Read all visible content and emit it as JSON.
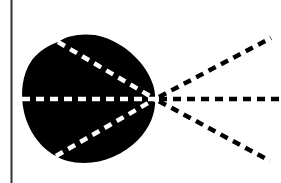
{
  "diagram": {
    "title": "",
    "colors": {
      "background": "#ffffff",
      "shape_fill": "#000000",
      "inner_dash": "#ffffff",
      "outer_dash": "#000000",
      "border_line": "#333333"
    },
    "border_line": {
      "x": 11.5,
      "y1": 0,
      "y2": 183
    },
    "focal_point": {
      "x": 155,
      "y": 99
    },
    "shape": {
      "type": "lobe",
      "path": "M 58 42 C 66 36, 80 33, 95 35 C 112 38, 128 48, 140 62 C 150 74, 156 88, 155 99 C 156 112, 150 128, 138 140 C 124 154, 104 163, 84 163 C 72 163, 62 160, 56 156 C 40 148, 28 130, 24 112 C 20 94, 22 74, 32 60 C 40 50, 49 45, 58 42 Z"
    },
    "rays": [
      {
        "id": "upper",
        "inner": {
          "x1": 58,
          "y1": 42
        },
        "outer": {
          "x2": 271,
          "y2": 38
        }
      },
      {
        "id": "middle",
        "inner": {
          "x1": 22,
          "y1": 99
        },
        "outer": {
          "x2": 281,
          "y2": 99
        }
      },
      {
        "id": "lower",
        "inner": {
          "x1": 56,
          "y1": 156
        },
        "outer": {
          "x2": 270,
          "y2": 161
        }
      }
    ],
    "dash_pattern": "8 6",
    "dash_width": 4.5
  }
}
